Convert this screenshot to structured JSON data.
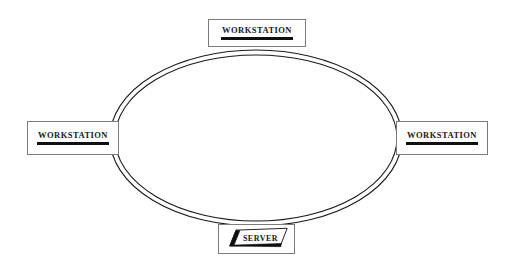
{
  "diagram": {
    "type": "ring-network-topology",
    "background_color": "#ffffff",
    "ring": {
      "name": "network-ring",
      "style": "double-line-ellipse",
      "stroke_color": "#1a1a1a",
      "center_x": 256,
      "center_y": 138,
      "outer_rx": 146,
      "outer_ry": 88,
      "inner_rx": 141,
      "inner_ry": 83
    },
    "nodes": [
      {
        "id": "workstation-top",
        "label": "WORKSTATION",
        "shape": "rectangle",
        "position": "top",
        "underline": true
      },
      {
        "id": "workstation-left",
        "label": "WORKSTATION",
        "shape": "rectangle",
        "position": "left",
        "underline": true
      },
      {
        "id": "workstation-right",
        "label": "WORKSTATION",
        "shape": "rectangle",
        "position": "right",
        "underline": true
      },
      {
        "id": "server",
        "label": "SERVER",
        "shape": "parallelogram",
        "position": "bottom",
        "underline": false,
        "accent_color": "#0d0f11"
      }
    ]
  }
}
